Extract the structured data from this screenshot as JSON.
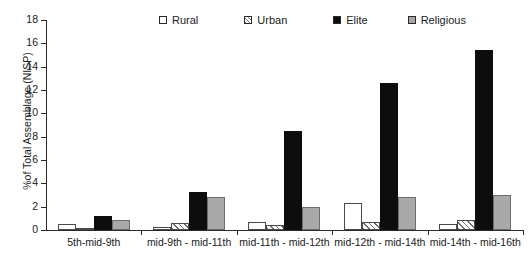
{
  "chart_data": {
    "type": "bar",
    "title": "",
    "xlabel": "",
    "ylabel": "%of Total Assemblage (NISP)",
    "ylim": [
      0,
      18
    ],
    "yticks": [
      0,
      2,
      4,
      6,
      8,
      10,
      12,
      14,
      16,
      18
    ],
    "grid": false,
    "legend_position": "top-center",
    "categories": [
      "5th-mid-9th",
      "mid-9th - mid-11th",
      "mid-11th - mid-12th",
      "mid-12th - mid-14th",
      "mid-14th - mid-16th"
    ],
    "series": [
      {
        "name": "Rural",
        "color": "#ffffff",
        "pattern": "solid",
        "values": [
          0.5,
          0.3,
          0.7,
          2.3,
          0.5
        ]
      },
      {
        "name": "Urban",
        "color": "#ffffff",
        "pattern": "hatch",
        "values": [
          0.05,
          0.6,
          0.4,
          0.7,
          0.9
        ]
      },
      {
        "name": "Elite",
        "color": "#0d0d0d",
        "pattern": "solid",
        "values": [
          1.2,
          3.3,
          8.5,
          12.6,
          15.4
        ]
      },
      {
        "name": "Religious",
        "color": "#a9a9a9",
        "pattern": "solid",
        "values": [
          0.9,
          2.8,
          2.0,
          2.8,
          3.0
        ]
      }
    ]
  },
  "axis": {
    "y_tick_labels": [
      "0",
      "2",
      "4",
      "6",
      "8",
      "10",
      "12",
      "14",
      "16",
      "18"
    ],
    "y_title": "%of Total Assemblage (NISP)"
  },
  "legend": {
    "entries": [
      {
        "label": "Rural"
      },
      {
        "label": "Urban"
      },
      {
        "label": "Elite"
      },
      {
        "label": "Religious"
      }
    ]
  }
}
